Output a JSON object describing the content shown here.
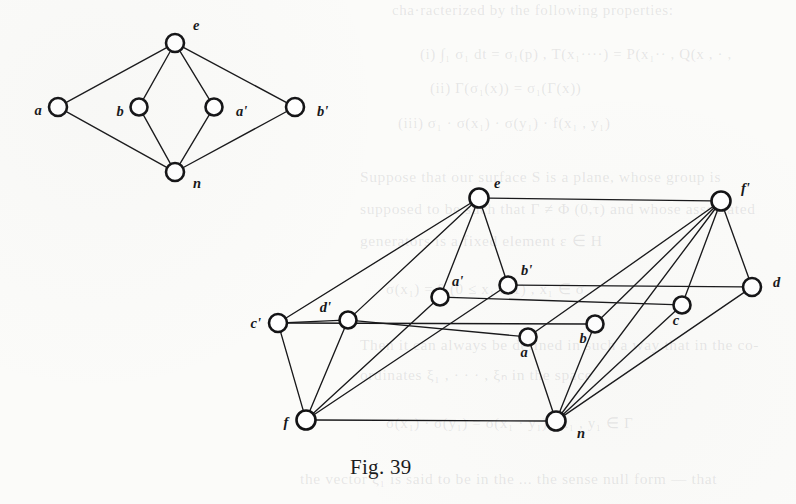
{
  "figure": {
    "caption": "Fig. 39",
    "caption_x": 350,
    "caption_y": 455
  },
  "background_text": [
    {
      "text": "cha·racterized by the following properties:",
      "x": 392,
      "y": 2,
      "size": 15
    },
    {
      "text": "(i)  ∫₁ σ₁ dt = σ₁(p) ,   T(x₁····) = P(x₁·· ,   Q(x , · ,",
      "x": 420,
      "y": 46,
      "size": 15
    },
    {
      "text": "(ii)  Γ(σ₁(x)) = σ₁(Γ(x))",
      "x": 430,
      "y": 80,
      "size": 15
    },
    {
      "text": "(iii)  σ₁ · σ(x₁) · σ(y₁) · f(x₁ , y₁)",
      "x": 398,
      "y": 115,
      "size": 15
    },
    {
      "text": "Suppose that our surface S is a plane, whose group is",
      "x": 360,
      "y": 168,
      "size": 15.5
    },
    {
      "text": "supposed to be such that Γ ≠ Φ (0,τ) and whose associated",
      "x": 360,
      "y": 200,
      "size": 15.5
    },
    {
      "text": "generators is a fixed element ε ∈ H",
      "x": 360,
      "y": 232,
      "size": 15.5
    },
    {
      "text": "σ(x₁) = 0 (0 ≤ x₁ ≤ 1) ,    x₁ ∈ σ .",
      "x": 386,
      "y": 280,
      "size": 15
    },
    {
      "text": "Then it can always be defined in such a way that in the co-",
      "x": 360,
      "y": 336,
      "size": 15.5
    },
    {
      "text": "ordinates ξ₁ , · · · , ξₙ in the space",
      "x": 360,
      "y": 366,
      "size": 15.5
    },
    {
      "text": "σ(x₁) · σ(y₁) = σ(x₁ · y₁) ,  x₁ , y₁ ∈ Γ",
      "x": 386,
      "y": 414,
      "size": 15
    },
    {
      "text": "the vector ξ₁ is said to be in the ... the sense null form — that",
      "x": 300,
      "y": 470,
      "size": 15.5
    }
  ],
  "graphs": [
    {
      "name": "upper-graph",
      "nodes": [
        {
          "id": "e",
          "label": "e",
          "x": 175,
          "y": 43,
          "r": 9,
          "lx": 193,
          "ly": 30,
          "anchor": "start"
        },
        {
          "id": "a",
          "label": "a",
          "x": 58,
          "y": 107,
          "r": 9,
          "lx": 38,
          "ly": 115,
          "anchor": "middle"
        },
        {
          "id": "b",
          "label": "b",
          "x": 139,
          "y": 107,
          "r": 8.5,
          "lx": 120,
          "ly": 116,
          "anchor": "middle"
        },
        {
          "id": "ap",
          "label": "a'",
          "x": 214,
          "y": 107,
          "r": 8.5,
          "lx": 236,
          "ly": 116,
          "anchor": "start"
        },
        {
          "id": "bp",
          "label": "b'",
          "x": 295,
          "y": 107,
          "r": 9,
          "lx": 317,
          "ly": 116,
          "anchor": "start"
        },
        {
          "id": "n",
          "label": "n",
          "x": 175,
          "y": 172,
          "r": 9,
          "lx": 193,
          "ly": 188,
          "anchor": "start"
        }
      ],
      "edges": [
        [
          "e",
          "a"
        ],
        [
          "e",
          "b"
        ],
        [
          "e",
          "ap"
        ],
        [
          "e",
          "bp"
        ],
        [
          "n",
          "a"
        ],
        [
          "n",
          "b"
        ],
        [
          "n",
          "ap"
        ],
        [
          "n",
          "bp"
        ]
      ]
    },
    {
      "name": "lower-graph",
      "nodes": [
        {
          "id": "e",
          "label": "e",
          "x": 479,
          "y": 198,
          "r": 9.5,
          "lx": 494,
          "ly": 188,
          "anchor": "start"
        },
        {
          "id": "fp",
          "label": "f'",
          "x": 721,
          "y": 201,
          "r": 9.5,
          "lx": 741,
          "ly": 193,
          "anchor": "start"
        },
        {
          "id": "bp",
          "label": "b'",
          "x": 508,
          "y": 285,
          "r": 8.5,
          "lx": 521,
          "ly": 275,
          "anchor": "start"
        },
        {
          "id": "ap",
          "label": "a'",
          "x": 440,
          "y": 297,
          "r": 8.5,
          "lx": 452,
          "ly": 286,
          "anchor": "start"
        },
        {
          "id": "d",
          "label": "d",
          "x": 752,
          "y": 287,
          "r": 9,
          "lx": 773,
          "ly": 287,
          "anchor": "start"
        },
        {
          "id": "c",
          "label": "c",
          "x": 682,
          "y": 305,
          "r": 8.5,
          "lx": 676,
          "ly": 325,
          "anchor": "middle"
        },
        {
          "id": "dp",
          "label": "d'",
          "x": 348,
          "y": 320,
          "r": 8.5,
          "lx": 331,
          "ly": 312,
          "anchor": "end"
        },
        {
          "id": "cp",
          "label": "c'",
          "x": 278,
          "y": 323,
          "r": 9,
          "lx": 261,
          "ly": 328,
          "anchor": "end"
        },
        {
          "id": "b",
          "label": "b",
          "x": 595,
          "y": 324,
          "r": 8.5,
          "lx": 583,
          "ly": 343,
          "anchor": "middle"
        },
        {
          "id": "a",
          "label": "a",
          "x": 528,
          "y": 337,
          "r": 8.5,
          "lx": 524,
          "ly": 357,
          "anchor": "middle"
        },
        {
          "id": "f",
          "label": "f",
          "x": 306,
          "y": 420,
          "r": 9.5,
          "lx": 286,
          "ly": 427,
          "anchor": "middle"
        },
        {
          "id": "n",
          "label": "n",
          "x": 556,
          "y": 421,
          "r": 9.5,
          "lx": 577,
          "ly": 438,
          "anchor": "start"
        }
      ],
      "edges": [
        [
          "e",
          "fp"
        ],
        [
          "e",
          "bp"
        ],
        [
          "e",
          "ap"
        ],
        [
          "e",
          "cp"
        ],
        [
          "e",
          "dp"
        ],
        [
          "fp",
          "d"
        ],
        [
          "fp",
          "c"
        ],
        [
          "fp",
          "b"
        ],
        [
          "fp",
          "a"
        ],
        [
          "fp",
          "n"
        ],
        [
          "bp",
          "d"
        ],
        [
          "ap",
          "c"
        ],
        [
          "cp",
          "b"
        ],
        [
          "dp",
          "a"
        ],
        [
          "cp",
          "dp"
        ],
        [
          "cp",
          "f"
        ],
        [
          "dp",
          "f"
        ],
        [
          "ap",
          "f"
        ],
        [
          "bp",
          "f"
        ],
        [
          "f",
          "n"
        ],
        [
          "a",
          "n"
        ],
        [
          "b",
          "n"
        ],
        [
          "c",
          "n"
        ],
        [
          "d",
          "n"
        ]
      ]
    }
  ]
}
